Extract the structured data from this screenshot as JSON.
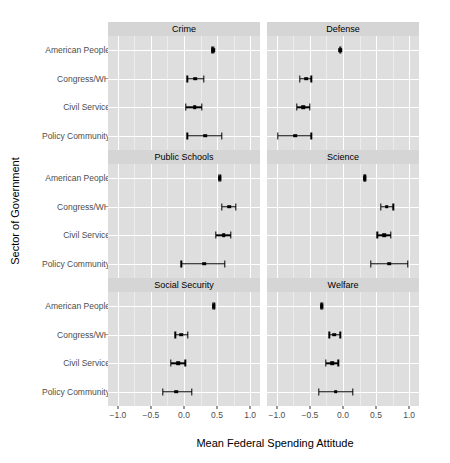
{
  "chart_data": {
    "type": "scatter",
    "subtype": "faceted-dot-and-whisker-plot",
    "title": "",
    "xlabel": "Mean Federal Spending Attitude",
    "ylabel": "Sector of Government",
    "xlim": [
      -1.15,
      1.15
    ],
    "xticks": [
      -1.0,
      -0.5,
      0.0,
      0.5,
      1.0
    ],
    "xticklabels": [
      "-1.0",
      "-0.5",
      "0.0",
      "0.5",
      "1.0"
    ],
    "categories": [
      "American People",
      "Congress/WH",
      "Civil Service",
      "Policy Community"
    ],
    "grid": true,
    "legend": null,
    "facet_layout": {
      "rows": 3,
      "cols": 2
    },
    "panels": [
      {
        "label": "Crime",
        "row": 0,
        "col": 0,
        "points": [
          {
            "category": "American People",
            "value": 0.44,
            "low": 0.43,
            "high": 0.45
          },
          {
            "category": "Congress/WH",
            "value": 0.17,
            "low": 0.05,
            "high": 0.3
          },
          {
            "category": "Civil Service",
            "value": 0.16,
            "low": 0.03,
            "high": 0.27
          },
          {
            "category": "Policy Community",
            "value": 0.32,
            "low": 0.05,
            "high": 0.57
          }
        ]
      },
      {
        "label": "Defense",
        "row": 0,
        "col": 1,
        "points": [
          {
            "category": "American People",
            "value": -0.04,
            "low": -0.05,
            "high": -0.03
          },
          {
            "category": "Congress/WH",
            "value": -0.56,
            "low": -0.65,
            "high": -0.48
          },
          {
            "category": "Civil Service",
            "value": -0.6,
            "low": -0.7,
            "high": -0.5
          },
          {
            "category": "Policy Community",
            "value": -0.72,
            "low": -0.99,
            "high": -0.48
          }
        ]
      },
      {
        "label": "Public Schools",
        "row": 1,
        "col": 0,
        "points": [
          {
            "category": "American People",
            "value": 0.54,
            "low": 0.53,
            "high": 0.55
          },
          {
            "category": "Congress/WH",
            "value": 0.68,
            "low": 0.57,
            "high": 0.78
          },
          {
            "category": "Civil Service",
            "value": 0.6,
            "low": 0.48,
            "high": 0.71
          },
          {
            "category": "Policy Community",
            "value": 0.31,
            "low": -0.04,
            "high": 0.62
          }
        ]
      },
      {
        "label": "Science",
        "row": 1,
        "col": 1,
        "points": [
          {
            "category": "American People",
            "value": 0.33,
            "low": 0.32,
            "high": 0.34
          },
          {
            "category": "Congress/WH",
            "value": 0.66,
            "low": 0.57,
            "high": 0.76
          },
          {
            "category": "Civil Service",
            "value": 0.62,
            "low": 0.52,
            "high": 0.72
          },
          {
            "category": "Policy Community",
            "value": 0.7,
            "low": 0.42,
            "high": 0.98
          }
        ]
      },
      {
        "label": "Social Security",
        "row": 2,
        "col": 0,
        "points": [
          {
            "category": "American People",
            "value": 0.45,
            "low": 0.44,
            "high": 0.46
          },
          {
            "category": "Congress/WH",
            "value": -0.04,
            "low": -0.13,
            "high": 0.06
          },
          {
            "category": "Civil Service",
            "value": -0.09,
            "low": -0.2,
            "high": 0.02
          },
          {
            "category": "Policy Community",
            "value": -0.12,
            "low": -0.32,
            "high": 0.12
          }
        ]
      },
      {
        "label": "Welfare",
        "row": 2,
        "col": 1,
        "points": [
          {
            "category": "American People",
            "value": -0.32,
            "low": -0.33,
            "high": -0.31
          },
          {
            "category": "Congress/WH",
            "value": -0.13,
            "low": -0.21,
            "high": -0.04
          },
          {
            "category": "Civil Service",
            "value": -0.16,
            "low": -0.26,
            "high": -0.07
          },
          {
            "category": "Policy Community",
            "value": -0.11,
            "low": -0.37,
            "high": 0.15
          }
        ]
      }
    ]
  },
  "colors": {
    "panel_background": "#dedede",
    "strip_background": "#d5d5d5",
    "gridline_major": "#ffffff",
    "gridline_minor": "#ececec",
    "mark": "#000000",
    "tick_label": "#4d4d4d",
    "axis_title": "#000000",
    "page_background": "#ffffff"
  }
}
